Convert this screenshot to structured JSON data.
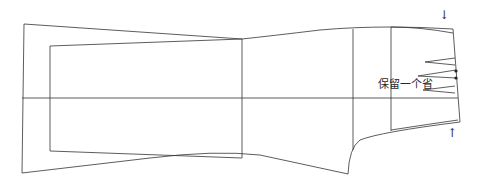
{
  "diagram": {
    "title": "",
    "annotation": "保留一个省",
    "arrows": {
      "top": "↓",
      "bottom": "↑"
    },
    "colors": {
      "stroke": "#333333",
      "background": "#ffffff"
    }
  }
}
